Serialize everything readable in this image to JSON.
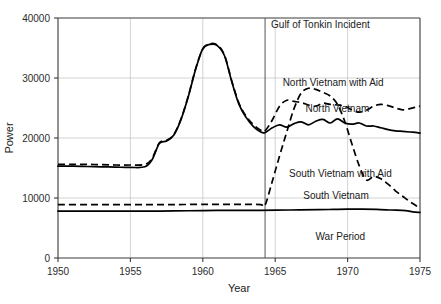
{
  "chart_data": {
    "type": "line",
    "title": "",
    "xlabel": "Year",
    "ylabel": "Power",
    "xlim": [
      1950,
      1975
    ],
    "ylim": [
      0,
      40000
    ],
    "grid": true,
    "legend_position": "inline-labels",
    "x_ticks": [
      "1950",
      "1955",
      "1960",
      "1965",
      "1970",
      "1975"
    ],
    "y_ticks": [
      "0",
      "10000",
      "20000",
      "30000",
      "40000"
    ],
    "annotations": [
      {
        "text": "Gulf of Tonkin Incident",
        "x": 1964.3,
        "y": 39000,
        "note": "vertical marker line at 1964.3"
      },
      {
        "text": "War Period",
        "x": 1969.5,
        "y": 3000
      }
    ],
    "series": [
      {
        "name": "North Vietnam with Aid",
        "style": "dashed",
        "label_x": 1969.0,
        "label_y": 28600,
        "x": [
          1950,
          1951,
          1952,
          1953,
          1954,
          1955,
          1956,
          1956.5,
          1957,
          1957.5,
          1958,
          1958.5,
          1959,
          1959.5,
          1960,
          1960.5,
          1961,
          1961.5,
          1962,
          1962.5,
          1963,
          1963.5,
          1964,
          1964.3,
          1964.8,
          1965.3,
          1965.8,
          1966.3,
          1966.8,
          1967.3,
          1967.8,
          1968.3,
          1968.8,
          1969.3,
          1969.8,
          1970.3,
          1970.8,
          1971.3,
          1971.8,
          1972.3,
          1972.8,
          1973.3,
          1973.8,
          1974.3,
          1974.8,
          1975
        ],
        "y": [
          15600,
          15600,
          15600,
          15550,
          15500,
          15500,
          15600,
          16600,
          19200,
          19600,
          20600,
          23200,
          27000,
          31500,
          34800,
          35700,
          35500,
          33800,
          29500,
          25800,
          23600,
          22200,
          21300,
          21200,
          23000,
          25300,
          26300,
          26100,
          25900,
          25500,
          25300,
          25800,
          25600,
          25500,
          25300,
          24700,
          24300,
          24600,
          25300,
          25600,
          25400,
          25000,
          24700,
          24900,
          25200,
          25300
        ]
      },
      {
        "name": "North Vietnam",
        "style": "solid",
        "label_x": 1969.3,
        "label_y": 24400,
        "x": [
          1950,
          1951,
          1952,
          1953,
          1954,
          1955,
          1956,
          1956.5,
          1957,
          1957.5,
          1958,
          1958.5,
          1959,
          1959.5,
          1960,
          1960.5,
          1961,
          1961.5,
          1962,
          1962.5,
          1963,
          1963.5,
          1964,
          1964.3,
          1964.8,
          1965.3,
          1965.8,
          1966.3,
          1966.8,
          1967.3,
          1967.8,
          1968.3,
          1968.8,
          1969.3,
          1969.8,
          1970.3,
          1970.8,
          1971.3,
          1971.8,
          1972.3,
          1972.8,
          1973.3,
          1973.8,
          1974.3,
          1974.8,
          1975
        ],
        "y": [
          15300,
          15300,
          15250,
          15200,
          15150,
          15100,
          15200,
          16400,
          19100,
          19500,
          20500,
          23100,
          26900,
          31400,
          34900,
          35600,
          35400,
          33700,
          29400,
          25600,
          23400,
          21900,
          21000,
          20900,
          21700,
          22200,
          21800,
          22400,
          22700,
          22200,
          22800,
          23100,
          22500,
          23200,
          22500,
          22300,
          22500,
          22000,
          22000,
          21700,
          21400,
          21200,
          21100,
          21000,
          20900,
          20800
        ]
      },
      {
        "name": "South Vietnam with Aid",
        "style": "dashed",
        "label_x": 1969.5,
        "label_y": 13500,
        "x": [
          1950,
          1952,
          1954,
          1956,
          1958,
          1960,
          1961,
          1962,
          1963,
          1964,
          1964.3,
          1964.8,
          1965.3,
          1965.8,
          1966.3,
          1966.8,
          1967.3,
          1967.8,
          1968.3,
          1968.8,
          1969.3,
          1969.8,
          1970.3,
          1970.8,
          1971.3,
          1971.8,
          1972.3,
          1972.8,
          1973.3,
          1973.8,
          1974.3,
          1974.8,
          1975
        ],
        "y": [
          8900,
          8900,
          8900,
          8900,
          8900,
          8950,
          8950,
          8950,
          8950,
          8900,
          8800,
          12800,
          17000,
          21000,
          24900,
          27500,
          28300,
          28100,
          27600,
          27000,
          25600,
          22800,
          19000,
          15400,
          13000,
          13600,
          13200,
          12300,
          11200,
          10300,
          9400,
          8600,
          8200
        ]
      },
      {
        "name": "South Vietnam",
        "style": "solid",
        "label_x": 1969.2,
        "label_y": 9900,
        "x": [
          1950,
          1952,
          1954,
          1956,
          1958,
          1960,
          1962,
          1964,
          1966,
          1968,
          1969,
          1970,
          1971,
          1972,
          1973,
          1974,
          1974.5,
          1975
        ],
        "y": [
          7800,
          7800,
          7800,
          7800,
          7850,
          7900,
          7950,
          7950,
          8000,
          8050,
          8100,
          8150,
          8150,
          8100,
          8000,
          7900,
          7700,
          7600
        ]
      }
    ]
  }
}
